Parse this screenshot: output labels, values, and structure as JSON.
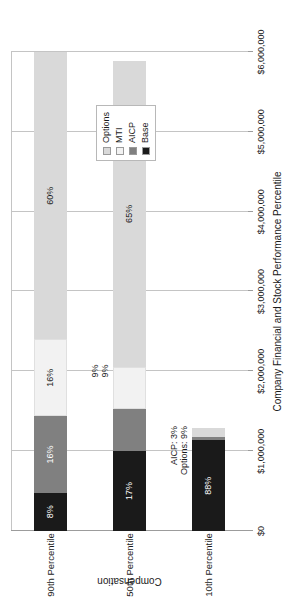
{
  "chart_data": {
    "type": "bar",
    "orientation": "horizontal-stacked",
    "title": "",
    "xlabel": "Company Financial and Stock Performance Percentile",
    "ylabel": "Compensation",
    "categories": [
      "10th Percentile",
      "50th Percentile",
      "90th Percentile"
    ],
    "tick_labels": [
      "$0",
      "$1,000,000",
      "$2,000,000",
      "$3,000,000",
      "$4,000,000",
      "$5,000,000",
      "$6,000,000"
    ],
    "tick_values": [
      0,
      1000000,
      2000000,
      3000000,
      4000000,
      5000000,
      6000000
    ],
    "ylim": [
      0,
      6000000
    ],
    "grid": true,
    "legend_position": "top-right",
    "series": [
      {
        "name": "Base",
        "color": "#1a1a1a",
        "values": [
          1000000,
          1000000,
          1000000
        ],
        "percent_labels": [
          "88%",
          "17%",
          "8%"
        ]
      },
      {
        "name": "AICP",
        "color": "#808080",
        "values": [
          34000,
          530000,
          2000000
        ],
        "percent_labels": [
          "AICP: 3%",
          "9%",
          "16%"
        ]
      },
      {
        "name": "MTI",
        "color": "#f2f2f2",
        "values": [
          0,
          530000,
          2000000
        ],
        "percent_labels": [
          "",
          "9%",
          "16%"
        ]
      },
      {
        "name": "Options",
        "color": "#d9d9d9",
        "values": [
          102000,
          3825000,
          7500000
        ],
        "percent_labels": [
          "Options: 9%",
          "65%",
          "60%"
        ]
      }
    ],
    "bars": [
      {
        "category": "10th Percentile",
        "total_percent": 100,
        "segments": [
          {
            "series": "Base",
            "percent_label": "88%",
            "start": 0,
            "end": 1136000,
            "label_placement": "inside",
            "color": "#1a1a1a"
          },
          {
            "series": "AICP",
            "percent_label": "AICP: 3%",
            "start": 1136000,
            "end": 1175000,
            "label_placement": "outside",
            "color": "#808080"
          },
          {
            "series": "Options",
            "percent_label": "Options: 9%",
            "start": 1175000,
            "end": 1291000,
            "label_placement": "outside",
            "color": "#d9d9d9"
          }
        ]
      },
      {
        "category": "50th Percentile",
        "total_percent": 100,
        "segments": [
          {
            "series": "Base",
            "percent_label": "17%",
            "start": 0,
            "end": 1000000,
            "label_placement": "inside",
            "color": "#1a1a1a"
          },
          {
            "series": "AICP",
            "percent_label": "9%",
            "start": 1000000,
            "end": 1530000,
            "label_placement": "outside",
            "color": "#808080"
          },
          {
            "series": "MTI",
            "percent_label": "9%",
            "start": 1530000,
            "end": 2060000,
            "label_placement": "outside",
            "color": "#f2f2f2"
          },
          {
            "series": "Options",
            "percent_label": "65%",
            "start": 2060000,
            "end": 5885000,
            "label_placement": "inside",
            "color": "#d9d9d9"
          }
        ]
      },
      {
        "category": "90th Percentile",
        "total_percent": 100,
        "segments": [
          {
            "series": "Base",
            "percent_label": "8%",
            "start": 0,
            "end": 480000,
            "label_placement": "inside",
            "color": "#1a1a1a"
          },
          {
            "series": "AICP",
            "percent_label": "16%",
            "start": 480000,
            "end": 1440000,
            "label_placement": "inside",
            "color": "#808080"
          },
          {
            "series": "MTI",
            "percent_label": "16%",
            "start": 1440000,
            "end": 2400000,
            "label_placement": "inside",
            "color": "#f2f2f2"
          },
          {
            "series": "Options",
            "percent_label": "60%",
            "start": 2400000,
            "end": 6000000,
            "label_placement": "inside",
            "color": "#d9d9d9"
          }
        ]
      }
    ]
  },
  "legend": {
    "items": [
      {
        "label": "Options",
        "color": "#d9d9d9"
      },
      {
        "label": "MTI",
        "color": "#f2f2f2"
      },
      {
        "label": "AICP",
        "color": "#808080"
      },
      {
        "label": "Base",
        "color": "#1a1a1a"
      }
    ]
  },
  "axes": {
    "value_axis_title": "Compensation",
    "category_axis_title": "Company Financial and Stock Performance Percentile",
    "ticks": [
      {
        "label": "$0",
        "value": 0
      },
      {
        "label": "$1,000,000",
        "value": 1000000
      },
      {
        "label": "$2,000,000",
        "value": 2000000
      },
      {
        "label": "$3,000,000",
        "value": 3000000
      },
      {
        "label": "$4,000,000",
        "value": 4000000
      },
      {
        "label": "$5,000,000",
        "value": 5000000
      },
      {
        "label": "$6,000,000",
        "value": 6000000
      }
    ]
  },
  "categories": [
    {
      "label": "10th Percentile"
    },
    {
      "label": "50th Percentile"
    },
    {
      "label": "90th Percentile"
    }
  ]
}
